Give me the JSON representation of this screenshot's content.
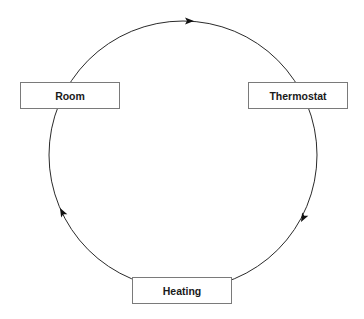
{
  "diagram": {
    "type": "cycle",
    "nodes": [
      {
        "id": "room",
        "label": "Room"
      },
      {
        "id": "thermostat",
        "label": "Thermostat"
      },
      {
        "id": "heating",
        "label": "Heating"
      }
    ],
    "edges": [
      {
        "from": "room",
        "to": "thermostat",
        "direction": "clockwise"
      },
      {
        "from": "thermostat",
        "to": "heating",
        "direction": "clockwise"
      },
      {
        "from": "heating",
        "to": "room",
        "direction": "clockwise"
      }
    ],
    "colors": {
      "line": "#2a2a2a",
      "box_border": "#7a7a7a",
      "text": "#1a1a1a",
      "background": "#ffffff"
    }
  }
}
